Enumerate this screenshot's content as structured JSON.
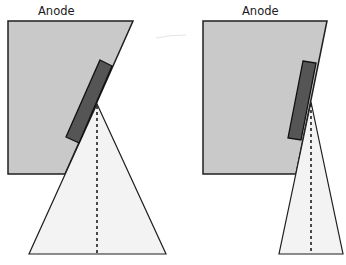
{
  "diagram": {
    "panels": [
      {
        "id": "large-angle",
        "label": "Anode",
        "description": "Larger anode angle producing a wide x-ray beam"
      },
      {
        "id": "small-angle",
        "label": "Anode",
        "description": "Smaller anode angle producing a narrow x-ray beam"
      }
    ],
    "colors": {
      "anode_fill": "#c9c9c9",
      "target_fill": "#555555",
      "beam_fill": "#f3f3f3",
      "outline": "#1f1f1f",
      "background": "#ffffff"
    }
  }
}
